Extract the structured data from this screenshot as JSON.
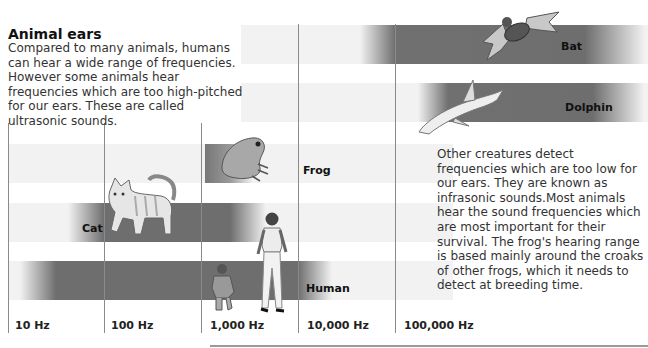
{
  "title": "Animal ears",
  "intro_text": "Compared to many animals, humans can hear a wide range of frequencies. However some animals hear frequencies which are too high-pitched for our ears. These are called ultrasonic sounds.",
  "side_text": "Other creatures detect frequencies which are too low for our ears. They are known as infrasonic sounds.Most animals hear the sound frequencies which are most important for their survival. The frog's hearing range is based mainly around the croaks of other frogs, which it needs to detect at breeding time.",
  "axis": {
    "ticks": [
      "10 Hz",
      "100 Hz",
      "1,000 Hz",
      "10,000 Hz",
      "100,000 Hz"
    ]
  },
  "animals": [
    {
      "name": "Bat",
      "icon": "bat-icon",
      "range_hz": [
        1000,
        200000
      ]
    },
    {
      "name": "Dolphin",
      "icon": "dolphin-icon",
      "range_hz": [
        2000,
        200000
      ]
    },
    {
      "name": "Frog",
      "icon": "frog-icon",
      "range_hz": [
        1000,
        2000
      ]
    },
    {
      "name": "Cat",
      "icon": "cat-icon",
      "range_hz": [
        60,
        65000
      ]
    },
    {
      "name": "Human",
      "icon": "human-icon",
      "range_hz": [
        20,
        20000
      ]
    }
  ],
  "colors": {
    "band_dark": "#6e6e6e",
    "band_light": "#f2f2f2",
    "gridline": "#8a8a8a"
  }
}
